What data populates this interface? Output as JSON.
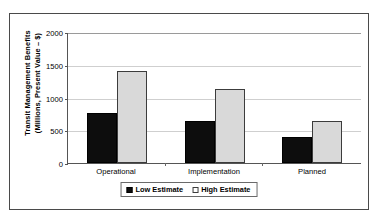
{
  "chart_data": {
    "type": "bar",
    "title": "",
    "xlabel": "",
    "ylabel_line1": "Transit Management Benefits",
    "ylabel_line2": "(Millions, Present Value – $)",
    "categories": [
      "Operational",
      "Implementation",
      "Planned"
    ],
    "series": [
      {
        "name": "Low Estimate",
        "values": [
          760,
          640,
          390
        ],
        "color": "#0d0d0d"
      },
      {
        "name": "High Estimate",
        "values": [
          1400,
          1130,
          640
        ],
        "color": "#d9d9d9"
      }
    ],
    "ylim": [
      0,
      2000
    ],
    "yticks": [
      0,
      500,
      1000,
      1500,
      2000
    ],
    "ytick_labels": [
      "0",
      "500",
      "1000",
      "1500",
      "2000"
    ],
    "grid": true,
    "legend_position": "bottom"
  },
  "legend": {
    "items": [
      {
        "label": "Low Estimate",
        "swatch": "filled-black-square"
      },
      {
        "label": "High Estimate",
        "swatch": "empty-white-square"
      }
    ]
  }
}
